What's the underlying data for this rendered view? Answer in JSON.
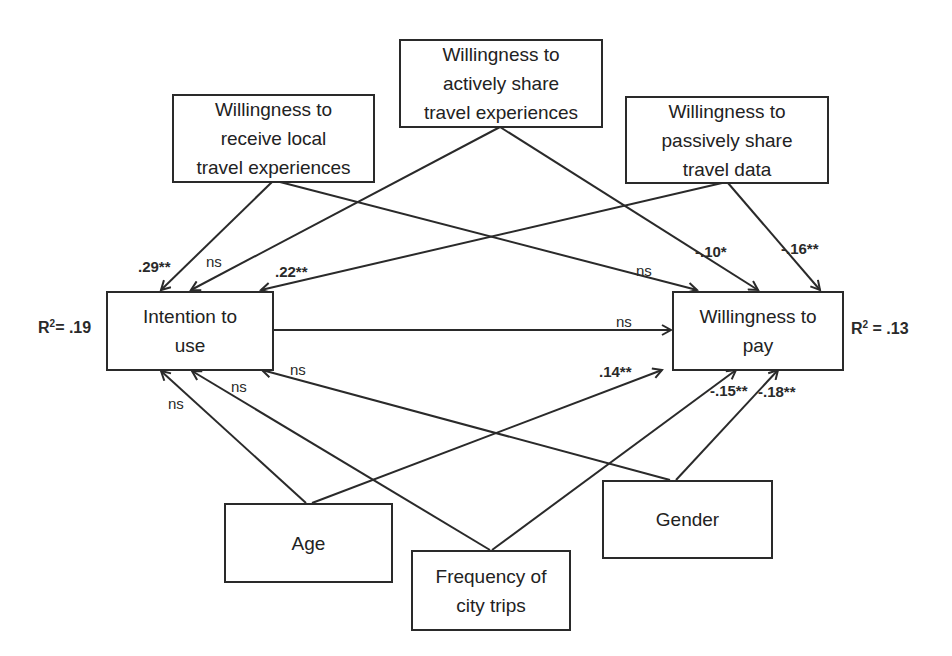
{
  "diagram": {
    "type": "path-model",
    "nodes": {
      "receive": {
        "label": "Willingness to\nreceive local\ntravel experiences"
      },
      "active": {
        "label": "Willingness to\nactively share\ntravel experiences"
      },
      "passive": {
        "label": "Willingness to\npassively share\ntravel data"
      },
      "intention": {
        "label": "Intention to\nuse"
      },
      "wtp": {
        "label": "Willingness to\npay"
      },
      "age": {
        "label": "Age"
      },
      "frequency": {
        "label": "Frequency of\ncity trips"
      },
      "gender": {
        "label": "Gender"
      }
    },
    "r_squared": {
      "intention": {
        "prefix": "R",
        "sup": "2",
        "value": "= .19"
      },
      "wtp": {
        "prefix": "R",
        "sup": "2",
        "value": " = .13"
      }
    },
    "edges": [
      {
        "from": "receive",
        "to": "intention",
        "label": ".29**"
      },
      {
        "from": "receive",
        "to": "wtp",
        "label": "ns"
      },
      {
        "from": "active",
        "to": "intention",
        "label": "ns"
      },
      {
        "from": "active",
        "to": "wtp",
        "label": "-.10*"
      },
      {
        "from": "passive",
        "to": "intention",
        "label": ".22**"
      },
      {
        "from": "passive",
        "to": "wtp",
        "label": "-.16**"
      },
      {
        "from": "intention",
        "to": "wtp",
        "label": "ns"
      },
      {
        "from": "age",
        "to": "intention",
        "label": "ns"
      },
      {
        "from": "age",
        "to": "wtp",
        "label": ".14**"
      },
      {
        "from": "frequency",
        "to": "intention",
        "label": "ns"
      },
      {
        "from": "frequency",
        "to": "wtp",
        "label": "-.15**"
      },
      {
        "from": "gender",
        "to": "intention",
        "label": "ns"
      },
      {
        "from": "gender",
        "to": "wtp",
        "label": "-.18**"
      }
    ]
  }
}
